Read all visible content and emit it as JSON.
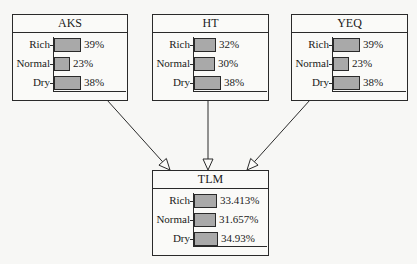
{
  "diagram": {
    "type": "bayesian-network",
    "nodes": [
      {
        "id": "AKS",
        "title": "AKS",
        "box": {
          "x": 12,
          "y": 14,
          "w": 116,
          "h": 87
        },
        "states": [
          {
            "label": "Rich",
            "value": 39,
            "display": "39%"
          },
          {
            "label": "Normal",
            "value": 23,
            "display": "23%"
          },
          {
            "label": "Dry",
            "value": 38,
            "display": "38%"
          }
        ]
      },
      {
        "id": "HT",
        "title": "HT",
        "box": {
          "x": 152,
          "y": 14,
          "w": 117,
          "h": 87
        },
        "states": [
          {
            "label": "Rich",
            "value": 32,
            "display": "32%"
          },
          {
            "label": "Normal",
            "value": 30,
            "display": "30%"
          },
          {
            "label": "Dry",
            "value": 38,
            "display": "38%"
          }
        ]
      },
      {
        "id": "YEQ",
        "title": "YEQ",
        "box": {
          "x": 291,
          "y": 14,
          "w": 117,
          "h": 87
        },
        "states": [
          {
            "label": "Rich",
            "value": 39,
            "display": "39%"
          },
          {
            "label": "Normal",
            "value": 23,
            "display": "23%"
          },
          {
            "label": "Dry",
            "value": 38,
            "display": "38%"
          }
        ]
      },
      {
        "id": "TLM",
        "title": "TLM",
        "box": {
          "x": 152,
          "y": 170,
          "w": 117,
          "h": 86
        },
        "states": [
          {
            "label": "Rich",
            "value": 33.413,
            "display": "33.413%"
          },
          {
            "label": "Normal",
            "value": 31.657,
            "display": "31.657%"
          },
          {
            "label": "Dry",
            "value": 34.93,
            "display": "34.93%"
          }
        ]
      }
    ],
    "edges": [
      {
        "from": "AKS",
        "to": "TLM",
        "x1": 107,
        "y1": 100,
        "x2": 170,
        "y2": 170
      },
      {
        "from": "HT",
        "to": "TLM",
        "x1": 208,
        "y1": 100,
        "x2": 208,
        "y2": 170
      },
      {
        "from": "YEQ",
        "to": "TLM",
        "x1": 310,
        "y1": 100,
        "x2": 247,
        "y2": 170
      }
    ],
    "colors": {
      "bar_fill": "#a9a9a9",
      "stroke": "#2a2a2a",
      "background": "#f7f7f5"
    }
  }
}
